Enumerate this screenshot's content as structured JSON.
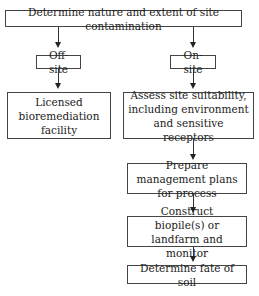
{
  "diagram": {
    "type": "flowchart",
    "nodes": {
      "root": "Determine nature and extent of site contamination",
      "offsite": "Off-site",
      "onsite": "On-site",
      "licensed": "Licensed bioremediation facility",
      "assess": "Assess site suitability, including environment and sensitive receptors",
      "prepare": "Prepare management plans for process",
      "construct": "Construct biopile(s) or landfarm and monitor",
      "fate": "Determine fate of soil"
    },
    "edges": [
      [
        "root",
        "offsite"
      ],
      [
        "root",
        "onsite"
      ],
      [
        "offsite",
        "licensed"
      ],
      [
        "onsite",
        "assess"
      ],
      [
        "assess",
        "prepare"
      ],
      [
        "prepare",
        "construct"
      ],
      [
        "construct",
        "fate"
      ]
    ]
  }
}
